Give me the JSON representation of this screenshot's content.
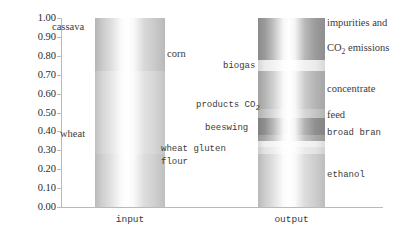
{
  "chart_data": {
    "type": "bar",
    "title": "",
    "xlabel": "",
    "ylabel": "",
    "categories": [
      "input",
      "output"
    ],
    "ylim": [
      0.0,
      1.0
    ],
    "ytick_labels": [
      "1.00",
      "0.90",
      "0.80",
      "0.70",
      "0.60",
      "0.50",
      "0.40",
      "0.30",
      "0.20",
      "0.10",
      "0.00"
    ],
    "ytick_values": [
      1.0,
      0.9,
      0.8,
      0.7,
      0.6,
      0.5,
      0.4,
      0.3,
      0.2,
      0.1,
      0.0
    ],
    "grid": false,
    "legend": "none",
    "stacked": true,
    "series": [
      {
        "name": "input",
        "segments": [
          {
            "label": "cassava",
            "value": 0.28,
            "y_bottom": 0.72,
            "y_top": 1.0,
            "color": "#c9c9c9",
            "label_side": "left"
          },
          {
            "label": "corn",
            "value": 0.44,
            "y_bottom": 0.28,
            "y_top": 0.72,
            "color": "#d5d5d5",
            "label_side": "right"
          },
          {
            "label": "wheat",
            "value": 0.28,
            "y_bottom": 0.0,
            "y_top": 0.28,
            "color": "#cfcfcf",
            "label_side": "left"
          }
        ]
      },
      {
        "name": "output",
        "segments": [
          {
            "label": "impurities and CO2 emissions",
            "value": 0.22,
            "y_bottom": 0.78,
            "y_top": 1.0,
            "color": "#9a9a9a",
            "label_side": "right"
          },
          {
            "label": "biogas",
            "value": 0.06,
            "y_bottom": 0.72,
            "y_top": 0.78,
            "color": "#ebebeb",
            "label_side": "left"
          },
          {
            "label": "concentrate",
            "value": 0.2,
            "y_bottom": 0.52,
            "y_top": 0.72,
            "color": "#b4b4b4",
            "label_side": "right"
          },
          {
            "label": "products CO2",
            "value": 0.05,
            "y_bottom": 0.47,
            "y_top": 0.52,
            "color": "#c4c4c4",
            "label_side": "left"
          },
          {
            "label": "feed",
            "value": 0.09,
            "y_bottom": 0.38,
            "y_top": 0.47,
            "color": "#8f8f8f",
            "label_side": "right"
          },
          {
            "label": "beeswing",
            "value": 0.03,
            "y_bottom": 0.35,
            "y_top": 0.38,
            "color": "#a8a8a8",
            "label_side": "left"
          },
          {
            "label": "broad bran",
            "value": 0.03,
            "y_bottom": 0.32,
            "y_top": 0.35,
            "color": "#efefef",
            "label_side": "right"
          },
          {
            "label": "wheat gluten flour",
            "value": 0.04,
            "y_bottom": 0.28,
            "y_top": 0.32,
            "color": "#e3e3e3",
            "label_side": "left"
          },
          {
            "label": "ethanol",
            "value": 0.28,
            "y_bottom": 0.0,
            "y_top": 0.28,
            "color": "#cdcdcd",
            "label_side": "right"
          }
        ]
      }
    ]
  },
  "axis": {
    "y_labels": [
      "1.00",
      "0.90",
      "0.80",
      "0.70",
      "0.60",
      "0.50",
      "0.40",
      "0.30",
      "0.20",
      "0.10",
      "0.00"
    ],
    "x_labels": [
      "input",
      "output"
    ]
  },
  "callouts": {
    "cassava": "cassava",
    "corn": "corn",
    "wheat": "wheat",
    "biogas": "biogas",
    "impurities_line1": "impurities and",
    "impurities_line2a": "CO",
    "impurities_line2b": "2",
    "impurities_line2c": " emissions",
    "concentrate": "concentrate",
    "products_co2_a": "products CO",
    "products_co2_b": "2",
    "feed": "feed",
    "beeswing": "beeswing",
    "broad_bran": "broad bran",
    "wheat_gluten_1": "wheat gluten",
    "wheat_gluten_2": "flour",
    "ethanol": "ethanol"
  },
  "colors": {
    "axis": "#b9b9b9",
    "text": "#3b3b3b",
    "bar_light": "#ffffff",
    "bar_mid": "#c9c9c9",
    "bar_dark": "#8f8f8f"
  }
}
